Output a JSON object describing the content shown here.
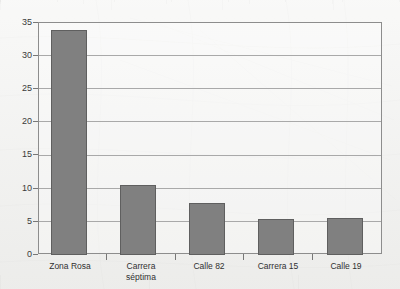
{
  "chart_data": {
    "type": "bar",
    "title": "",
    "subtitle": "",
    "xlabel": "",
    "ylabel": "",
    "categories": [
      "Zona Rosa",
      "Carrera séptima",
      "Calle 82",
      "Carrera 15",
      "Calle 19"
    ],
    "category_lines": [
      [
        "Zona Rosa"
      ],
      [
        "Carrera",
        "séptima"
      ],
      [
        "Calle 82"
      ],
      [
        "Carrera 15"
      ],
      [
        "Calle 19"
      ]
    ],
    "values": [
      34,
      10.5,
      7.8,
      5.4,
      5.6
    ],
    "ylim": [
      0,
      35
    ],
    "yticks": [
      0,
      5,
      10,
      15,
      20,
      25,
      30,
      35
    ],
    "ytick_labels": [
      "0",
      "5",
      "10",
      "15",
      "20",
      "25",
      "30",
      "35"
    ],
    "grid": true,
    "legend": false,
    "legend_position": "none",
    "bar_color": "#808080",
    "bar_edge_color": "#5f5f5f",
    "gridline_color": "#a9a9a9",
    "axis_color": "#8d8d8d",
    "background_color": "#f1f1ef",
    "text_color": "#303030"
  }
}
